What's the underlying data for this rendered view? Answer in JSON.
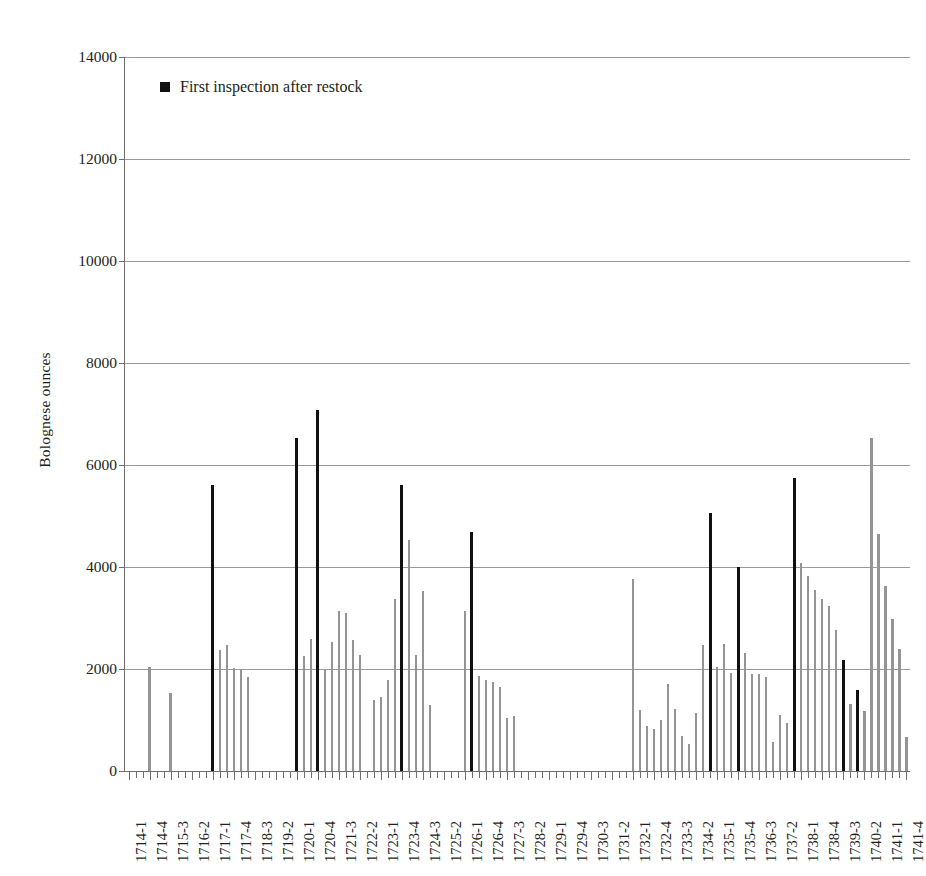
{
  "chart_data": {
    "type": "bar",
    "title": "",
    "xlabel": "",
    "ylabel": "Bolognese ounces",
    "ylim": [
      0,
      14000
    ],
    "ytick_step": 2000,
    "yticks": [
      0,
      2000,
      4000,
      6000,
      8000,
      10000,
      12000,
      14000
    ],
    "grid": true,
    "legend_position": "top-left",
    "legend": [
      {
        "label": "First inspection after restock",
        "color": "#111111",
        "marker": "square"
      }
    ],
    "series_colors": {
      "normal": "#949494",
      "highlight": "#111111"
    },
    "xtick_labels": [
      "1714-1",
      "1714-4",
      "1715-3",
      "1716-2",
      "1717-1",
      "1717-4",
      "1718-3",
      "1719-2",
      "1720-1",
      "1720-4",
      "1721-3",
      "1722-2",
      "1723-1",
      "1723-4",
      "1724-3",
      "1725-2",
      "1726-1",
      "1726-4",
      "1727-3",
      "1728-2",
      "1729-1",
      "1729-4",
      "1730-3",
      "1731-2",
      "1732-1",
      "1732-4",
      "1733-3",
      "1734-2",
      "1735-1",
      "1735-4",
      "1736-3",
      "1737-2",
      "1738-1",
      "1738-4",
      "1739-3",
      "1740-2",
      "1741-1",
      "1741-4"
    ],
    "xtick_label_every": 3,
    "categories": [
      "1714-1",
      "1714-2",
      "1714-3",
      "1714-4",
      "1715-1",
      "1715-2",
      "1715-3",
      "1715-4",
      "1716-1",
      "1716-2",
      "1716-3",
      "1716-4",
      "1717-1",
      "1717-2",
      "1717-3",
      "1717-4",
      "1718-1",
      "1718-2",
      "1718-3",
      "1718-4",
      "1719-1",
      "1719-2",
      "1719-3",
      "1719-4",
      "1720-1",
      "1720-2",
      "1720-3",
      "1720-4",
      "1721-1",
      "1721-2",
      "1721-3",
      "1721-4",
      "1722-1",
      "1722-2",
      "1722-3",
      "1722-4",
      "1723-1",
      "1723-2",
      "1723-3",
      "1723-4",
      "1724-1",
      "1724-2",
      "1724-3",
      "1724-4",
      "1725-1",
      "1725-2",
      "1725-3",
      "1725-4",
      "1726-1",
      "1726-2",
      "1726-3",
      "1726-4",
      "1727-1",
      "1727-2",
      "1727-3",
      "1727-4",
      "1728-1",
      "1728-2",
      "1728-3",
      "1728-4",
      "1729-1",
      "1729-2",
      "1729-3",
      "1729-4",
      "1730-1",
      "1730-2",
      "1730-3",
      "1730-4",
      "1731-1",
      "1731-2",
      "1731-3",
      "1731-4",
      "1732-1",
      "1732-2",
      "1732-3",
      "1732-4",
      "1733-1",
      "1733-2",
      "1733-3",
      "1733-4",
      "1734-1",
      "1734-2",
      "1734-3",
      "1734-4",
      "1735-1",
      "1735-2",
      "1735-3",
      "1735-4",
      "1736-1",
      "1736-2",
      "1736-3",
      "1736-4",
      "1737-1",
      "1737-2",
      "1737-3",
      "1737-4",
      "1738-1",
      "1738-2",
      "1738-3",
      "1738-4",
      "1739-1",
      "1739-2",
      "1739-3",
      "1739-4",
      "1740-1",
      "1740-2",
      "1740-3",
      "1740-4",
      "1741-1",
      "1741-2",
      "1741-3",
      "1741-4"
    ],
    "values": [
      0,
      0,
      0,
      2030,
      0,
      0,
      1520,
      0,
      0,
      0,
      0,
      0,
      5600,
      2380,
      2470,
      2020,
      1990,
      1840,
      0,
      0,
      0,
      0,
      0,
      0,
      6520,
      2250,
      2590,
      7070,
      2010,
      2530,
      3130,
      3100,
      2570,
      2280,
      0,
      1400,
      1460,
      1790,
      3380,
      5600,
      4520,
      2270,
      3520,
      1300,
      0,
      0,
      0,
      0,
      3130,
      4680,
      1860,
      1790,
      1740,
      1640,
      1030,
      1080,
      0,
      0,
      0,
      0,
      0,
      0,
      0,
      0,
      0,
      0,
      0,
      0,
      0,
      0,
      0,
      0,
      3770,
      1190,
      880,
      830,
      1000,
      1700,
      1210,
      690,
      530,
      1130,
      2480,
      5050,
      2030,
      2500,
      1930,
      4000,
      2320,
      1900,
      1900,
      1850,
      570,
      1090,
      950,
      5740,
      4080,
      3820,
      3540,
      3380,
      3230,
      2760,
      2180,
      1310,
      1590,
      1180,
      6520,
      4650,
      3630,
      2990,
      2390,
      660
    ],
    "highlight_indices": [
      12,
      24,
      27,
      39,
      49,
      83,
      87,
      95,
      102,
      104
    ],
    "highlight_label": "First inspection after restock"
  }
}
